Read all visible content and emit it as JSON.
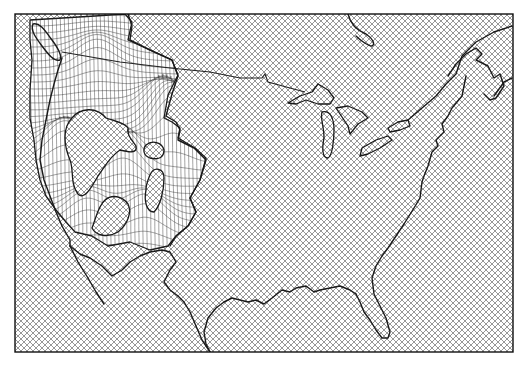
{
  "map": {
    "subject": "Contiguous United States 3D wireframe terrain surface",
    "style": "black-and-white line drawing",
    "background_pattern": "crosshatch",
    "colors": {
      "ink": "#1a1a1a",
      "paper": "#ffffff",
      "hatch": "#555555"
    },
    "features": [
      {
        "name": "us-canada-border",
        "type": "border"
      },
      {
        "name": "great-lakes",
        "type": "water"
      },
      {
        "name": "atlantic-coast",
        "type": "coastline"
      },
      {
        "name": "gulf-coast",
        "type": "coastline"
      },
      {
        "name": "pacific-coast",
        "type": "coastline"
      },
      {
        "name": "florida-peninsula",
        "type": "coastline"
      },
      {
        "name": "western-mountains",
        "type": "terrain-mesh"
      }
    ]
  }
}
